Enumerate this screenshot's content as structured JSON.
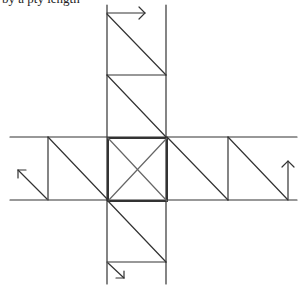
{
  "caption": "by a pty length",
  "diagram": {
    "type": "cube-net-sketch",
    "stroke_color": "#333333",
    "background": "#ffffff",
    "arrows": [
      {
        "id": "top-arrow",
        "direction": "right"
      },
      {
        "id": "left-arrow",
        "direction": "up-left"
      },
      {
        "id": "right-arrow",
        "direction": "up"
      },
      {
        "id": "bottom-arrow",
        "direction": "down-right"
      }
    ]
  }
}
